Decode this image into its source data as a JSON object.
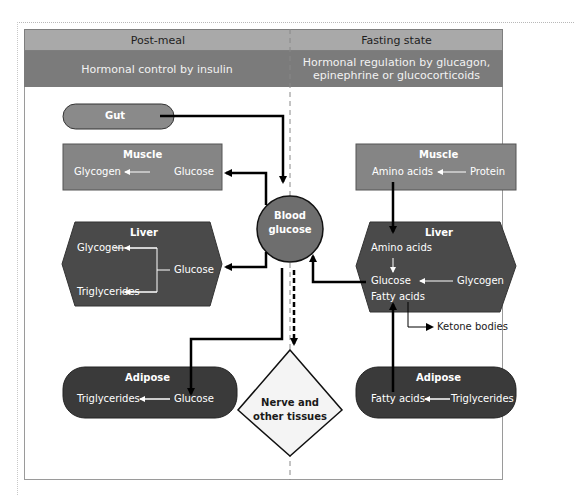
{
  "header": {
    "left_title": "Post-meal",
    "right_title": "Fasting state",
    "left_subtitle": "Hormonal control by insulin",
    "right_subtitle_line1": "Hormonal regulation by glucagon,",
    "right_subtitle_line2": "epinephrine or glucocorticoids"
  },
  "post_meal": {
    "gut": {
      "label": "Gut"
    },
    "muscle": {
      "label": "Muscle",
      "from": "Glucose",
      "to": "Glycogen"
    },
    "liver": {
      "label": "Liver",
      "from": "Glucose",
      "to1": "Glycogen",
      "to2": "Triglycerides"
    },
    "adipose": {
      "label": "Adipose",
      "from": "Glucose",
      "to": "Triglycerides"
    }
  },
  "center": {
    "blood_line1": "Blood",
    "blood_line2": "glucose",
    "nerve_line1": "Nerve and",
    "nerve_line2": "other tissues"
  },
  "fasting": {
    "muscle": {
      "label": "Muscle",
      "from": "Protein",
      "to": "Amino acids"
    },
    "liver": {
      "label": "Liver",
      "amino": "Amino acids",
      "glucose": "Glucose",
      "glycogen": "Glycogen",
      "fatty": "Fatty acids"
    },
    "ketone": "Ketone bodies",
    "adipose": {
      "label": "Adipose",
      "from": "Triglycerides",
      "to": "Fatty acids"
    }
  },
  "colors": {
    "header_light": "#a9a9a9",
    "header_dark": "#7b7b7b",
    "muscle_fill": "#858585",
    "liver_fill": "#4a4a4a",
    "adipose_fill": "#3a3a3a",
    "gut_fill": "#8a8a8a",
    "blood_fill": "#6e6e6e",
    "nerve_fill": "#f4f4f4"
  }
}
